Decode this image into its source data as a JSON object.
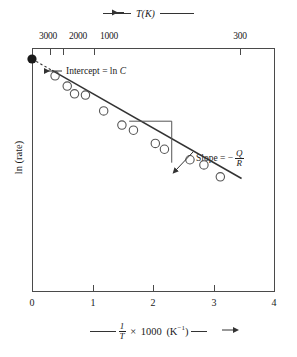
{
  "figure": {
    "kind": "arrhenius-plot"
  },
  "top_axis": {
    "title_text": "T(K)",
    "arrow_direction": "left",
    "tick_labels": [
      "3000",
      "2000",
      "1000",
      "300"
    ],
    "tick_x_fraction": [
      0.074,
      0.128,
      0.255,
      0.855
    ]
  },
  "bottom_axis": {
    "tick_labels": [
      "0",
      "1",
      "2",
      "3",
      "4"
    ],
    "label_prefix_rule": true,
    "label_one": "1",
    "label_T": "T",
    "label_times": "×",
    "label_1000": "1000",
    "label_units": "(K",
    "label_units_exp": "−1",
    "label_units_close": ")",
    "arrow_direction": "right"
  },
  "y_axis": {
    "title": "ln (rate)"
  },
  "annotations": {
    "intercept": {
      "text_prefix": "Intercept = ln ",
      "text_symbol": "C"
    },
    "slope": {
      "text_prefix": "Slope = −",
      "numerator": "Q",
      "denominator": "R"
    }
  },
  "colors": {
    "frame": "#4a4a4a",
    "line": "#333333",
    "marker_stroke": "#555555",
    "intercept_dot": "#1a1a1a",
    "text": "#1a1a1a"
  },
  "chart_data": {
    "type": "scatter",
    "title": "",
    "xlabel": "1/T × 1000 (K⁻¹)",
    "ylabel": "ln (rate)",
    "xlim": [
      0,
      4
    ],
    "ylim": [
      0,
      10
    ],
    "grid": false,
    "legend": "none",
    "top_axis": {
      "label": "T(K)",
      "ticks": [
        {
          "T": 3000,
          "x": 0.333
        },
        {
          "T": 2000,
          "x": 0.5
        },
        {
          "T": 1000,
          "x": 1.0
        },
        {
          "T": 300,
          "x": 3.333
        }
      ]
    },
    "points": [
      {
        "x": 0.38,
        "y": 8.86
      },
      {
        "x": 0.58,
        "y": 8.44
      },
      {
        "x": 0.7,
        "y": 8.12
      },
      {
        "x": 0.88,
        "y": 8.07
      },
      {
        "x": 1.18,
        "y": 7.42
      },
      {
        "x": 1.48,
        "y": 6.84
      },
      {
        "x": 1.67,
        "y": 6.63
      },
      {
        "x": 2.03,
        "y": 6.09
      },
      {
        "x": 2.18,
        "y": 5.85
      },
      {
        "x": 2.6,
        "y": 5.42
      },
      {
        "x": 2.83,
        "y": 5.21
      },
      {
        "x": 3.1,
        "y": 4.72
      }
    ],
    "fit_line": {
      "intercept_y": 9.55,
      "slope": -1.42,
      "x_from": 0.0,
      "x_to": 3.45,
      "dashed_until_x": 0.33
    },
    "intercept_marker": {
      "x": 0.0,
      "y": 9.55,
      "style": "filled-circle"
    },
    "slope_triangle": {
      "x1": 1.6,
      "x2": 2.3,
      "y_top": 7.0,
      "y_bottom": 5.3
    }
  }
}
